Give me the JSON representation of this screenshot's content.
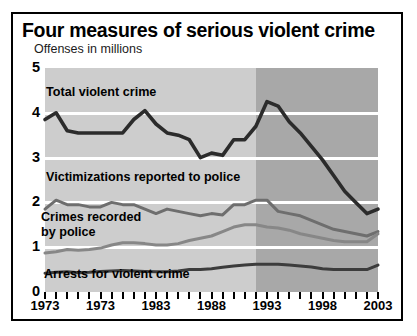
{
  "header": {
    "title": "Four measures of serious violent crime",
    "subtitle": "Offenses in millions"
  },
  "axis": {
    "y_ticks": [
      "5",
      "4",
      "3",
      "2",
      "1",
      "0"
    ],
    "x_ticks_labeled": [
      "1973",
      "1973",
      "1983",
      "1988",
      "1993",
      "1998",
      "2003"
    ]
  },
  "annotations": {
    "total": "Total violent crime",
    "victimizations": "Victimizations reported to police",
    "recorded_line1": "Crimes recorded",
    "recorded_line2": "by police",
    "arrests": "Arrests for violent crime"
  },
  "colors": {
    "plot_background": "#cdcdcd",
    "plot_shade": "#a8a8a8",
    "gridline": "#ffffff",
    "total_line": "#2b2b2b",
    "victimizations_line": "#6e6e6e",
    "recorded_line": "#878787",
    "arrests_line": "#3c3c3c",
    "frame": "#000000"
  },
  "chart_data": {
    "type": "line",
    "title": "Four measures of serious violent crime",
    "subtitle": "Offenses in millions",
    "xlabel": "",
    "ylabel": "Offenses in millions",
    "ylim": [
      0,
      5
    ],
    "xlim": [
      1973,
      2003
    ],
    "grid": true,
    "legend": "inline annotations",
    "shaded_region": {
      "from": 1992,
      "to": 2003,
      "note": "darker background band"
    },
    "x": [
      1973,
      1974,
      1975,
      1976,
      1977,
      1978,
      1979,
      1980,
      1981,
      1982,
      1983,
      1984,
      1985,
      1986,
      1987,
      1988,
      1989,
      1990,
      1991,
      1992,
      1993,
      1994,
      1995,
      1996,
      1997,
      1998,
      1999,
      2000,
      2001,
      2002,
      2003
    ],
    "series": [
      {
        "name": "Total violent crime",
        "values": [
          3.85,
          4.0,
          3.6,
          3.55,
          3.55,
          3.55,
          3.55,
          3.55,
          3.85,
          4.05,
          3.75,
          3.55,
          3.5,
          3.4,
          3.0,
          3.1,
          3.05,
          3.4,
          3.4,
          3.7,
          4.25,
          4.15,
          3.8,
          3.55,
          3.25,
          2.95,
          2.6,
          2.25,
          2.0,
          1.75,
          1.85
        ],
        "color": "#2b2b2b"
      },
      {
        "name": "Victimizations reported to police",
        "values": [
          1.85,
          2.05,
          1.95,
          1.95,
          1.9,
          1.9,
          2.0,
          1.95,
          1.95,
          1.85,
          1.75,
          1.85,
          1.8,
          1.75,
          1.7,
          1.75,
          1.72,
          1.95,
          1.95,
          2.05,
          2.05,
          1.8,
          1.75,
          1.7,
          1.6,
          1.5,
          1.4,
          1.35,
          1.3,
          1.25,
          1.35
        ],
        "color": "#6e6e6e"
      },
      {
        "name": "Crimes recorded by police",
        "values": [
          0.87,
          0.9,
          0.95,
          0.93,
          0.95,
          0.98,
          1.05,
          1.1,
          1.1,
          1.08,
          1.05,
          1.05,
          1.08,
          1.15,
          1.2,
          1.25,
          1.35,
          1.45,
          1.5,
          1.5,
          1.45,
          1.43,
          1.38,
          1.3,
          1.25,
          1.2,
          1.15,
          1.12,
          1.12,
          1.12,
          1.3
        ],
        "color": "#878787"
      },
      {
        "name": "Arrests for violent crime",
        "values": [
          0.42,
          0.44,
          0.45,
          0.43,
          0.44,
          0.46,
          0.47,
          0.48,
          0.47,
          0.46,
          0.45,
          0.45,
          0.47,
          0.5,
          0.5,
          0.52,
          0.55,
          0.58,
          0.6,
          0.62,
          0.62,
          0.62,
          0.6,
          0.58,
          0.56,
          0.52,
          0.5,
          0.5,
          0.5,
          0.5,
          0.6
        ],
        "color": "#3c3c3c"
      }
    ]
  }
}
